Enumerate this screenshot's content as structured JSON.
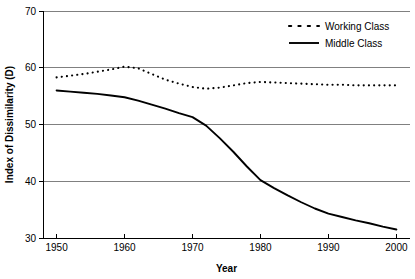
{
  "chart_data": {
    "type": "line",
    "title": "",
    "xlabel": "Year",
    "ylabel": "Index of Dissimilarity (D)",
    "xlim": [
      1948,
      2002
    ],
    "ylim": [
      30,
      70
    ],
    "xticks": [
      1950,
      1960,
      1970,
      1980,
      1990,
      2000
    ],
    "yticks": [
      30,
      40,
      50,
      60,
      70
    ],
    "grid": true,
    "legend_position": "top-right",
    "x": [
      1950,
      1952,
      1954,
      1956,
      1958,
      1960,
      1962,
      1964,
      1966,
      1968,
      1970,
      1972,
      1974,
      1976,
      1978,
      1980,
      1982,
      1984,
      1986,
      1988,
      1990,
      1992,
      1994,
      1996,
      1998,
      2000
    ],
    "series": [
      {
        "name": "Working Class",
        "style": "dashed",
        "color": "#000000",
        "values": [
          58.3,
          58.6,
          58.9,
          59.3,
          59.7,
          60.2,
          59.9,
          58.9,
          57.9,
          57.2,
          56.6,
          56.3,
          56.5,
          56.9,
          57.3,
          57.5,
          57.4,
          57.3,
          57.2,
          57.1,
          57.0,
          57.0,
          56.9,
          56.9,
          56.9,
          56.9
        ]
      },
      {
        "name": "Middle Class",
        "style": "solid",
        "color": "#000000",
        "values": [
          56.0,
          55.8,
          55.6,
          55.4,
          55.1,
          54.8,
          54.2,
          53.5,
          52.8,
          52.0,
          51.3,
          49.8,
          47.6,
          45.2,
          42.6,
          40.2,
          38.8,
          37.5,
          36.3,
          35.2,
          34.3,
          33.7,
          33.1,
          32.6,
          32.0,
          31.5
        ]
      }
    ]
  },
  "axes": {
    "y_label": "Index of Dissimilarity (D)",
    "x_label": "Year",
    "y_tick_labels": [
      "70",
      "60",
      "50",
      "40",
      "30"
    ],
    "x_tick_labels": [
      "1950",
      "1960",
      "1970",
      "1980",
      "1990",
      "2000"
    ]
  },
  "legend": {
    "items": [
      {
        "label": "Working Class",
        "marker": "dashed-line"
      },
      {
        "label": "Middle Class",
        "marker": "solid-line"
      }
    ]
  }
}
